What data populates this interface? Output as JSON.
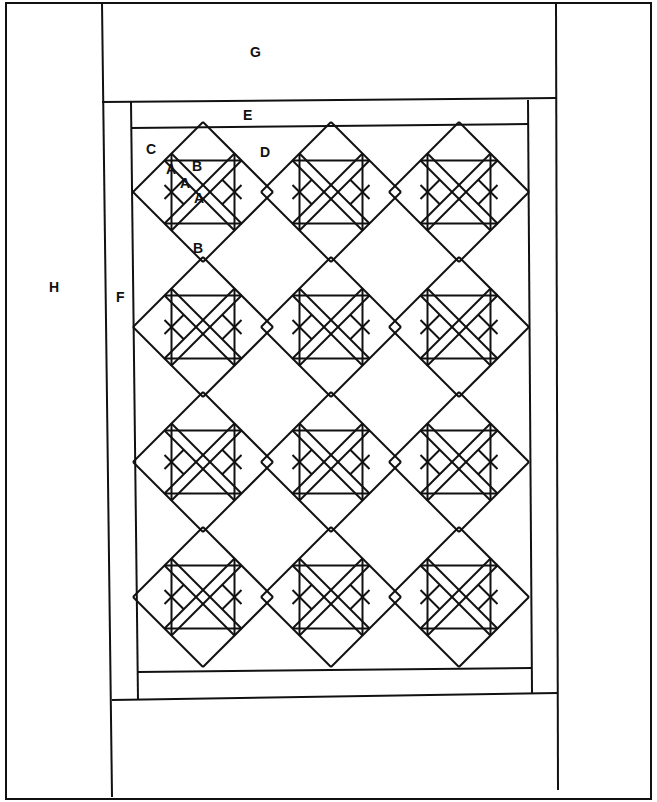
{
  "diagram": {
    "ink_color": "#111111",
    "background": "#ffffff",
    "labels": {
      "G": "G",
      "E": "E",
      "C": "C",
      "D": "D",
      "F": "F",
      "H": "H",
      "A1": "A",
      "A2": "A",
      "A3": "A",
      "B1": "B",
      "B2": "B"
    },
    "layout": {
      "blocks_rows": 4,
      "blocks_cols": 3,
      "block_type": "on-point pieced block with corner triangles B and small triangles A"
    }
  }
}
